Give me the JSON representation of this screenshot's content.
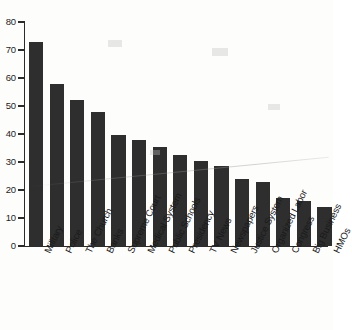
{
  "chart_data": {
    "type": "bar",
    "title": "",
    "subtitle": "",
    "xlabel": "",
    "ylabel": "",
    "categories": [
      "Military",
      "Police",
      "The Church",
      "Banks",
      "Supreme Court",
      "Medical System",
      "Public Schools",
      "Presidency",
      "TV News",
      "Newspapers",
      "Justice System",
      "Organized Labor",
      "Congress",
      "Big Business",
      "HMOs"
    ],
    "values": [
      73,
      58,
      52,
      48,
      39.5,
      38,
      35.5,
      32.5,
      30.5,
      28.5,
      24,
      23,
      17,
      16,
      14
    ],
    "ylim": [
      0,
      80
    ],
    "ytick_labels": [
      "80",
      "70",
      "60",
      "50",
      "40",
      "30",
      "20",
      "10",
      "0"
    ],
    "ytick_values": [
      80,
      70,
      60,
      50,
      40,
      30,
      20,
      10,
      0
    ],
    "grid": false,
    "legend": false,
    "legend_position": "none",
    "bar_color": "#2e2e2e",
    "axis_color": "#2b2b2b",
    "background_color": "#fdfdfc"
  },
  "axis": {
    "y_axis_name": "y-axis",
    "x_axis_name": "x-axis"
  }
}
